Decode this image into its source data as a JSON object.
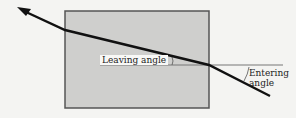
{
  "diagram": {
    "labels": {
      "leaving_angle": "Leaving angle",
      "entering_line1": "Entering",
      "entering_line2": "angle"
    },
    "colors": {
      "background": "#f4f4f2",
      "block_fill": "#cfcfcd",
      "block_border": "#555555",
      "ray": "#111111",
      "normal_line": "#777777"
    },
    "block": {
      "x": 65,
      "y": 11,
      "width": 144,
      "height": 97
    },
    "ray_points": [
      [
        270,
        96
      ],
      [
        209,
        65
      ],
      [
        65,
        30
      ],
      [
        17,
        7
      ]
    ],
    "normal_line": {
      "x1": 100,
      "x2": 283,
      "y": 65
    }
  }
}
